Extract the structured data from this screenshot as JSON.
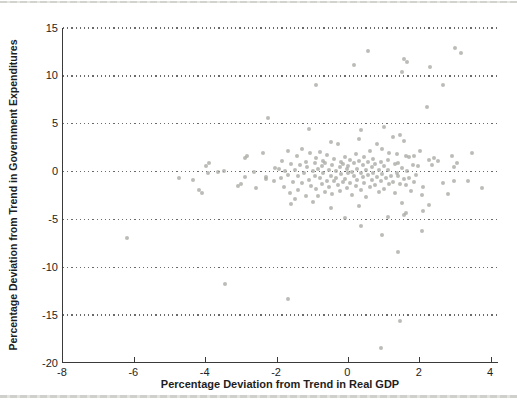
{
  "figure": {
    "background": "#ffffff",
    "top_rule_color": "#d2d2ce",
    "bottom_rule_color": "#cfcfcb"
  },
  "chart_data": {
    "type": "scatter",
    "title": "",
    "xlabel": "Percentage Deviation from Trend in Real GDP",
    "ylabel": "Percentage Deviation from Trend in Government Expenditures",
    "xlim": [
      -8,
      4.22
    ],
    "ylim": [
      -20,
      15
    ],
    "x_ticks": [
      -8,
      -6,
      -4,
      -2,
      0,
      2,
      4
    ],
    "y_ticks": [
      15,
      10,
      5,
      0,
      -5,
      -10,
      -15,
      -20
    ],
    "grid_y_values": [
      15,
      10,
      5,
      0,
      -5,
      -10,
      -15
    ],
    "grid_style": "dotted",
    "legend": "none",
    "axis_color": "#3a3a3a",
    "point_color": "rgba(168,168,163,0.78)",
    "points": [
      [
        -6.2,
        -6.9
      ],
      [
        -3.45,
        -11.7
      ],
      [
        -1.7,
        -13.3
      ],
      [
        0.9,
        -18.4
      ],
      [
        1.45,
        -15.6
      ],
      [
        1.4,
        -8.4
      ],
      [
        0.35,
        -5.7
      ],
      [
        0.95,
        -6.6
      ],
      [
        2.05,
        -6.2
      ],
      [
        -0.1,
        -4.9
      ],
      [
        1.1,
        -4.7
      ],
      [
        1.55,
        -4.5
      ],
      [
        1.6,
        -4.3
      ],
      [
        0.55,
        12.6
      ],
      [
        3.0,
        12.9
      ],
      [
        3.15,
        12.4
      ],
      [
        0.15,
        11.1
      ],
      [
        1.55,
        11.8
      ],
      [
        1.65,
        11.5
      ],
      [
        2.3,
        10.9
      ],
      [
        1.5,
        10.4
      ],
      [
        -0.9,
        9.0
      ],
      [
        2.65,
        9.0
      ],
      [
        2.2,
        6.7
      ],
      [
        -2.25,
        5.6
      ],
      [
        -4.75,
        -0.65
      ],
      [
        -4.35,
        -0.9
      ],
      [
        -4.2,
        -1.95
      ],
      [
        -4.1,
        -2.2
      ],
      [
        -4.0,
        0.55
      ],
      [
        -3.9,
        0.85
      ],
      [
        -3.95,
        -0.2
      ],
      [
        -3.65,
        -0.05
      ],
      [
        -3.5,
        0.1
      ],
      [
        -3.1,
        -1.5
      ],
      [
        -3.0,
        -1.25
      ],
      [
        -2.9,
        1.4
      ],
      [
        -2.85,
        1.6
      ],
      [
        -2.9,
        -0.6
      ],
      [
        -2.65,
        0.0
      ],
      [
        -2.6,
        -1.75
      ],
      [
        -2.4,
        1.9
      ],
      [
        -2.3,
        -0.8
      ],
      [
        -2.3,
        -0.55
      ],
      [
        -2.1,
        -1.0
      ],
      [
        -2.05,
        0.4
      ],
      [
        2.25,
        1.25
      ],
      [
        2.4,
        1.45
      ],
      [
        2.5,
        1.1
      ],
      [
        2.9,
        1.6
      ],
      [
        3.45,
        1.95
      ],
      [
        3.05,
        0.9
      ],
      [
        2.35,
        0.65
      ],
      [
        2.95,
        0.5
      ],
      [
        3.35,
        -1.0
      ],
      [
        3.75,
        -1.7
      ],
      [
        2.65,
        -1.2
      ],
      [
        2.95,
        -0.95
      ],
      [
        2.1,
        -1.65
      ],
      [
        2.05,
        -2.45
      ],
      [
        2.8,
        -2.35
      ],
      [
        2.25,
        -3.5
      ],
      [
        2.1,
        -4.1
      ],
      [
        2.0,
        2.2
      ],
      [
        -1.95,
        0.3
      ],
      [
        -1.9,
        -0.7
      ],
      [
        -1.85,
        1.1
      ],
      [
        -1.8,
        -1.6
      ],
      [
        -1.78,
        0.1
      ],
      [
        -1.7,
        2.1
      ],
      [
        -1.7,
        -0.35
      ],
      [
        -1.65,
        -2.2
      ],
      [
        -1.6,
        0.8
      ],
      [
        -1.6,
        -3.4
      ],
      [
        -1.55,
        -1.1
      ],
      [
        -1.5,
        0.2
      ],
      [
        -1.5,
        -2.9
      ],
      [
        -1.45,
        1.6
      ],
      [
        -1.4,
        -0.5
      ],
      [
        -1.4,
        -1.9
      ],
      [
        -1.35,
        0.65
      ],
      [
        -1.3,
        2.4
      ],
      [
        -1.3,
        -1.2
      ],
      [
        -1.25,
        -0.1
      ],
      [
        -1.2,
        1.0
      ],
      [
        -1.2,
        -2.5
      ],
      [
        -1.15,
        0.45
      ],
      [
        -1.1,
        4.5
      ],
      [
        -1.1,
        -0.9
      ],
      [
        -1.08,
        1.9
      ],
      [
        -1.05,
        -1.5
      ],
      [
        -1.0,
        0.1
      ],
      [
        -1.0,
        -3.2
      ],
      [
        -0.95,
        0.9
      ],
      [
        -0.95,
        -0.45
      ],
      [
        -0.9,
        1.4
      ],
      [
        -0.9,
        -1.8
      ],
      [
        -0.85,
        0.3
      ],
      [
        -0.85,
        -2.6
      ],
      [
        -0.8,
        2.0
      ],
      [
        -0.8,
        -0.7
      ],
      [
        -0.75,
        0.6
      ],
      [
        -0.75,
        -1.3
      ],
      [
        -0.7,
        1.1
      ],
      [
        -0.7,
        -0.2
      ],
      [
        -0.65,
        -2.1
      ],
      [
        -0.65,
        0.85
      ],
      [
        -0.6,
        -0.95
      ],
      [
        -0.6,
        1.7
      ],
      [
        -0.55,
        0.2
      ],
      [
        -0.55,
        -1.6
      ],
      [
        -0.5,
        3.1
      ],
      [
        -0.5,
        -0.5
      ],
      [
        -0.5,
        -3.8
      ],
      [
        -0.45,
        0.7
      ],
      [
        -0.45,
        -2.3
      ],
      [
        -0.4,
        1.3
      ],
      [
        -0.4,
        -1.0
      ],
      [
        -0.35,
        0.1
      ],
      [
        -0.35,
        -0.65
      ],
      [
        -0.3,
        2.9
      ],
      [
        -0.3,
        -1.4
      ],
      [
        -0.25,
        0.5
      ],
      [
        -0.25,
        -2.0
      ],
      [
        -0.2,
        1.05
      ],
      [
        -0.2,
        -0.3
      ],
      [
        -0.15,
        -1.1
      ],
      [
        -0.15,
        0.8
      ],
      [
        -0.1,
        1.5
      ],
      [
        -0.1,
        -0.8
      ],
      [
        -0.05,
        0.25
      ],
      [
        -0.05,
        -1.7
      ],
      [
        0.0,
        0.6
      ],
      [
        0.0,
        -0.15
      ],
      [
        0.05,
        1.2
      ],
      [
        0.05,
        -1.2
      ],
      [
        0.1,
        0.0
      ],
      [
        0.1,
        -2.4
      ],
      [
        0.15,
        0.9
      ],
      [
        0.15,
        -0.5
      ],
      [
        0.2,
        1.8
      ],
      [
        0.2,
        -1.5
      ],
      [
        0.25,
        0.3
      ],
      [
        0.25,
        -0.9
      ],
      [
        0.3,
        3.45
      ],
      [
        0.3,
        1.1
      ],
      [
        0.3,
        -3.6
      ],
      [
        0.35,
        4.3
      ],
      [
        0.35,
        -0.1
      ],
      [
        0.35,
        -1.9
      ],
      [
        0.4,
        0.7
      ],
      [
        0.4,
        -0.6
      ],
      [
        0.45,
        1.5
      ],
      [
        0.45,
        -1.2
      ],
      [
        0.5,
        0.2
      ],
      [
        0.5,
        -2.7
      ],
      [
        0.55,
        0.95
      ],
      [
        0.55,
        -0.4
      ],
      [
        0.6,
        2.2
      ],
      [
        0.6,
        -1.6
      ],
      [
        0.65,
        0.5
      ],
      [
        0.65,
        -0.85
      ],
      [
        0.7,
        1.3
      ],
      [
        0.7,
        -0.1
      ],
      [
        0.75,
        -1.4
      ],
      [
        0.75,
        0.8
      ],
      [
        0.8,
        2.9
      ],
      [
        0.8,
        -0.6
      ],
      [
        0.85,
        0.15
      ],
      [
        0.85,
        -2.1
      ],
      [
        0.9,
        1.0
      ],
      [
        0.9,
        -1.0
      ],
      [
        0.95,
        2.4
      ],
      [
        0.95,
        -0.3
      ],
      [
        1.0,
        4.65
      ],
      [
        1.0,
        0.6
      ],
      [
        1.0,
        -1.8
      ],
      [
        1.05,
        -0.7
      ],
      [
        1.1,
        1.25
      ],
      [
        1.1,
        0.2
      ],
      [
        1.15,
        1.95
      ],
      [
        1.15,
        -1.3
      ],
      [
        1.2,
        -0.5
      ],
      [
        1.25,
        3.6
      ],
      [
        1.25,
        -1.1
      ],
      [
        1.3,
        0.8
      ],
      [
        1.3,
        -2.2
      ],
      [
        1.35,
        1.8
      ],
      [
        1.35,
        -0.2
      ],
      [
        1.4,
        -0.45
      ],
      [
        1.4,
        0.9
      ],
      [
        1.45,
        3.8
      ],
      [
        1.45,
        -1.35
      ],
      [
        1.5,
        0.4
      ],
      [
        1.5,
        -3.3
      ],
      [
        1.55,
        3.2
      ],
      [
        1.55,
        -0.8
      ],
      [
        1.6,
        1.6
      ],
      [
        1.6,
        -1.45
      ],
      [
        1.65,
        0.1
      ],
      [
        1.7,
        1.5
      ],
      [
        1.7,
        -0.65
      ],
      [
        1.75,
        -2.0
      ],
      [
        1.8,
        0.7
      ],
      [
        1.85,
        1.6
      ],
      [
        1.85,
        -1.1
      ],
      [
        1.9,
        -0.35
      ],
      [
        1.95,
        0.55
      ]
    ]
  }
}
